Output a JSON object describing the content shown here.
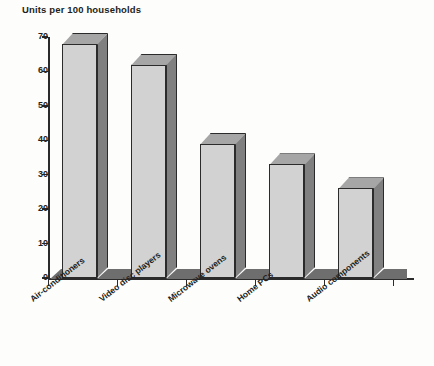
{
  "chart_data": {
    "type": "bar",
    "title": "Units per 100 households",
    "xlabel": "",
    "ylabel": "Units per 100 households",
    "categories": [
      "Air-conditioners",
      "Video disc players",
      "Microwave ovens",
      "Home PCs",
      "Audio components"
    ],
    "values": [
      68,
      62,
      39,
      33,
      26
    ],
    "ylim": [
      0,
      70
    ],
    "yticks": [
      0,
      10,
      20,
      30,
      40,
      50,
      60,
      70
    ],
    "ytick_labels": [
      "0",
      "10",
      "20",
      "30",
      "40",
      "50",
      "60",
      "70"
    ],
    "grid": false,
    "legend": null,
    "style": "3d-column",
    "colors": {
      "bar_front": "#d2d2d2",
      "bar_side": "#808080",
      "bar_top": "#a6a6a6",
      "outline": "#2b2b2b",
      "axis": "#2b2b2b",
      "text": "#231f20",
      "background": "#fdfdfc",
      "floor": "#6e6e6e"
    }
  }
}
